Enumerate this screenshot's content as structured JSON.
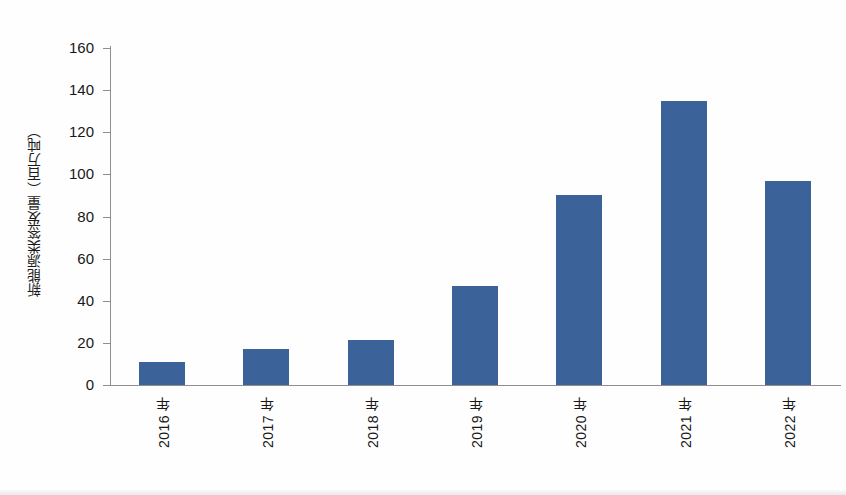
{
  "chart_data": {
    "type": "bar",
    "title": "",
    "subtitle": "",
    "xlabel": "",
    "ylabel": "新能源类签发量（百万吨）",
    "categories": [
      "2016 年",
      "2017 年",
      "2018 年",
      "2019 年",
      "2020 年",
      "2021 年",
      "2022 年"
    ],
    "values": [
      11,
      17,
      21.5,
      47,
      90,
      135,
      97
    ],
    "series": [
      {
        "name": "新能源类签发量",
        "values": [
          11,
          17,
          21.5,
          47,
          90,
          135,
          97
        ]
      }
    ],
    "ylim": [
      0,
      160
    ],
    "ytick_labels": [
      "0",
      "20",
      "40",
      "60",
      "80",
      "100",
      "120",
      "140",
      "160"
    ],
    "ytick_values": [
      0,
      20,
      40,
      60,
      80,
      100,
      120,
      140,
      160
    ],
    "grid": false,
    "legend": false,
    "legend_position": "none",
    "bar_color": "#3b6399",
    "axis_color": "#8e8e8e",
    "background_color": "#ffffff",
    "annotations": []
  }
}
